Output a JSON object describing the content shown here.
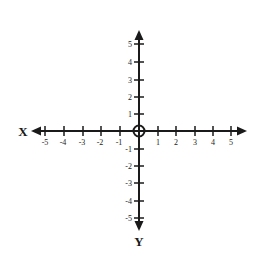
{
  "diagram": {
    "type": "cartesian-plane",
    "x_axis_label": "X",
    "y_axis_label": "Y",
    "x_ticks": [
      "-5",
      "-4",
      "-3",
      "-2",
      "-1",
      "1",
      "2",
      "3",
      "4",
      "5"
    ],
    "y_ticks": [
      "5",
      "4",
      "3",
      "2",
      "1",
      "-1",
      "-2",
      "-3",
      "-4",
      "-5"
    ],
    "x_range": [
      -5,
      5
    ],
    "y_range": [
      -5,
      5
    ],
    "origin_marker": "open-circle",
    "color": "#1a1a1a"
  }
}
